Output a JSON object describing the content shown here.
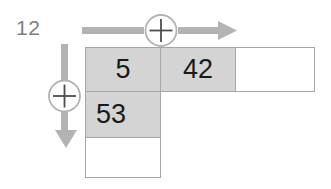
{
  "label": {
    "text": "12"
  },
  "operators": {
    "row_operator": {
      "symbol": "+",
      "direction": "right",
      "icon": "plus-circle-icon",
      "arrow_icon": "arrow-right-icon"
    },
    "column_operator": {
      "symbol": "+",
      "direction": "down",
      "icon": "plus-circle-icon",
      "arrow_icon": "arrow-down-icon"
    }
  },
  "colors": {
    "cell_fill": "#d4d4d4",
    "cell_border": "#a6a6a6",
    "arrow": "#b3b3b3",
    "label_text": "#7f7f7f",
    "cell_text": "#1a1a1a",
    "empty_fill": "#ffffff"
  },
  "grid": {
    "rows": [
      {
        "cells": [
          {
            "value": "5",
            "filled": true,
            "align": "center"
          },
          {
            "value": "42",
            "filled": true,
            "align": "center"
          },
          {
            "value": "",
            "filled": false,
            "align": "center"
          }
        ]
      },
      {
        "cells": [
          {
            "value": "53",
            "filled": true,
            "align": "left"
          }
        ]
      },
      {
        "cells": [
          {
            "value": "",
            "filled": false,
            "align": "center"
          }
        ]
      }
    ]
  }
}
